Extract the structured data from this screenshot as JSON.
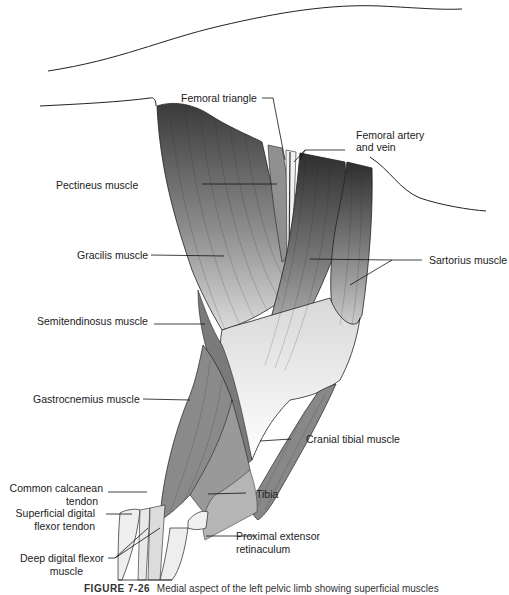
{
  "figure": {
    "caption_number": "FIGURE 7-26",
    "caption_text": "Medial aspect of the left pelvic limb showing superficial muscles"
  },
  "labels": {
    "femoral_triangle": "Femoral triangle",
    "femoral_artery_vein_1": "Femoral artery",
    "femoral_artery_vein_2": "and vein",
    "pectineus": "Pectineus muscle",
    "gracilis": "Gracilis muscle",
    "sartorius": "Sartorius muscle",
    "semitendinosus": "Semitendinosus muscle",
    "gastrocnemius": "Gastrocnemius muscle",
    "cranial_tibial": "Cranial tibial muscle",
    "common_calcanean_1": "Common calcanean",
    "common_calcanean_2": "tendon",
    "tibia": "Tibia",
    "superficial_digital_flexor_1": "Superficial digital",
    "superficial_digital_flexor_2": "flexor tendon",
    "proximal_extensor_1": "Proximal extensor",
    "proximal_extensor_2": "retinaculum",
    "deep_digital_flexor_1": "Deep digital flexor",
    "deep_digital_flexor_2": "muscle"
  },
  "colors": {
    "muscle_dark": "#3a3a3a",
    "muscle_mid": "#8a8a8a",
    "muscle_light": "#d8d8d8",
    "tendon": "#f4f4f4",
    "line": "#111111"
  }
}
